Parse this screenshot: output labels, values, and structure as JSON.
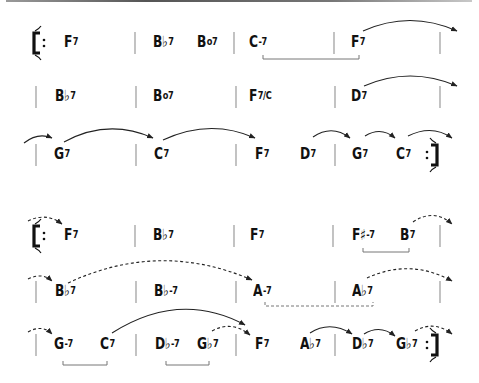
{
  "sections": [
    {
      "name": "chorus-1",
      "rows": [
        {
          "y": 43,
          "repeat_start": true,
          "repeat_end": false,
          "barlines": [
            135,
            234,
            334,
            440
          ],
          "chords": [
            {
              "root": "F",
              "quality": "7",
              "x": 64
            },
            {
              "root": "B♭",
              "quality": "7",
              "x": 153
            },
            {
              "root": "B",
              "quality": "o7",
              "x": 197
            },
            {
              "root": "C",
              "quality": "-7",
              "x": 249
            },
            {
              "root": "F",
              "quality": "7",
              "x": 351
            }
          ]
        },
        {
          "y": 97,
          "repeat_start": false,
          "repeat_end": false,
          "barlines": [
            36,
            136,
            236,
            335,
            440
          ],
          "chords": [
            {
              "root": "B♭",
              "quality": "7",
              "x": 55
            },
            {
              "root": "B",
              "quality": "o7",
              "x": 153
            },
            {
              "root": "F",
              "quality": "7/C",
              "x": 249
            },
            {
              "root": "D",
              "quality": "7",
              "x": 351
            }
          ]
        },
        {
          "y": 155,
          "repeat_start": false,
          "repeat_end": true,
          "barlines": [
            36,
            136,
            236,
            335
          ],
          "chords": [
            {
              "root": "G",
              "quality": "7",
              "x": 54
            },
            {
              "root": "C",
              "quality": "7",
              "x": 154
            },
            {
              "root": "F",
              "quality": "7",
              "x": 255
            },
            {
              "root": "D",
              "quality": "7",
              "x": 300
            },
            {
              "root": "G",
              "quality": "7",
              "x": 352
            },
            {
              "root": "C",
              "quality": "7",
              "x": 396
            }
          ]
        }
      ]
    },
    {
      "name": "chorus-2",
      "rows": [
        {
          "y": 236,
          "repeat_start": true,
          "repeat_end": false,
          "barlines": [
            135,
            234,
            333,
            440
          ],
          "chords": [
            {
              "root": "F",
              "quality": "7",
              "x": 64
            },
            {
              "root": "B♭",
              "quality": "7",
              "x": 153
            },
            {
              "root": "F",
              "quality": "7",
              "x": 250
            },
            {
              "root": "F♯",
              "quality": "-7",
              "x": 352
            },
            {
              "root": "B",
              "quality": "7",
              "x": 400
            }
          ]
        },
        {
          "y": 292,
          "repeat_start": false,
          "repeat_end": false,
          "barlines": [
            36,
            136,
            236,
            335,
            440
          ],
          "chords": [
            {
              "root": "B♭",
              "quality": "7",
              "x": 55
            },
            {
              "root": "B♭",
              "quality": "-7",
              "x": 154
            },
            {
              "root": "A",
              "quality": "-7",
              "x": 253
            },
            {
              "root": "A♭",
              "quality": "7",
              "x": 352
            }
          ]
        },
        {
          "y": 345,
          "repeat_start": false,
          "repeat_end": true,
          "barlines": [
            36,
            136,
            236,
            335
          ],
          "chords": [
            {
              "root": "G",
              "quality": "-7",
              "x": 54
            },
            {
              "root": "C",
              "quality": "7",
              "x": 100
            },
            {
              "root": "D♭",
              "quality": "-7",
              "x": 155
            },
            {
              "root": "G♭",
              "quality": "7",
              "x": 197
            },
            {
              "root": "F",
              "quality": "7",
              "x": 255
            },
            {
              "root": "A♭",
              "quality": "7",
              "x": 300
            },
            {
              "root": "D♭",
              "quality": "7",
              "x": 352
            },
            {
              "root": "G♭",
              "quality": "7",
              "x": 396
            }
          ]
        }
      ]
    }
  ],
  "annotations": {
    "solid_arcs": [
      [
        363,
        31,
        410,
        10,
        457,
        31
      ],
      [
        364,
        86,
        410,
        66,
        457,
        86
      ],
      [
        24,
        143,
        38,
        132,
        52,
        138
      ],
      [
        64,
        142,
        108,
        118,
        153,
        138
      ],
      [
        163,
        140,
        210,
        118,
        255,
        138
      ],
      [
        313,
        137,
        332,
        124,
        350,
        138
      ],
      [
        365,
        136,
        381,
        126,
        395,
        138
      ],
      [
        408,
        136,
        432,
        124,
        452,
        138
      ],
      [
        112,
        333,
        180,
        290,
        245,
        325
      ],
      [
        310,
        333,
        330,
        320,
        352,
        334
      ],
      [
        364,
        334,
        380,
        324,
        395,
        336
      ]
    ],
    "dashed_arcs": [
      [
        28,
        221,
        46,
        212,
        62,
        224
      ],
      [
        413,
        222,
        434,
        208,
        452,
        224
      ],
      [
        28,
        279,
        42,
        272,
        52,
        281
      ],
      [
        68,
        283,
        160,
        240,
        252,
        280
      ],
      [
        367,
        278,
        410,
        258,
        452,
        281
      ],
      [
        28,
        332,
        42,
        324,
        52,
        334
      ],
      [
        212,
        331,
        232,
        320,
        250,
        335
      ],
      [
        415,
        331,
        434,
        320,
        452,
        334
      ]
    ],
    "solid_brackets": [
      [
        263,
        359,
        59
      ],
      [
        363,
        409,
        252
      ],
      [
        63,
        107,
        365
      ],
      [
        166,
        209,
        365
      ]
    ],
    "dashed_brackets": [
      [
        265,
        373,
        306
      ]
    ]
  }
}
